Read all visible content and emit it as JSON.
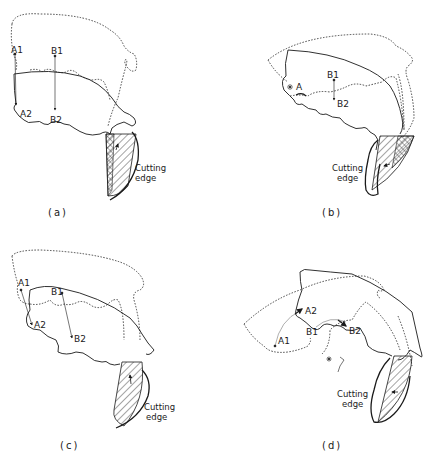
{
  "figure": {
    "panels": [
      {
        "id": "a",
        "caption": "(a)",
        "points": {
          "A1": "A1",
          "A2": "A2",
          "B1": "B1",
          "B2": "B2"
        },
        "edge_label_line1": "Cutting",
        "edge_label_line2": "edge"
      },
      {
        "id": "b",
        "caption": "(b)",
        "points": {
          "A": "A",
          "B1": "B1",
          "B2": "B2"
        },
        "edge_label_line1": "Cutting",
        "edge_label_line2": "edge"
      },
      {
        "id": "c",
        "caption": "(c)",
        "points": {
          "A1": "A1",
          "A2": "A2",
          "B1": "B1",
          "B2": "B2"
        },
        "edge_label_line1": "Cutting",
        "edge_label_line2": "edge"
      },
      {
        "id": "d",
        "caption": "(d)",
        "points": {
          "A1": "A1",
          "A2": "A2",
          "B1": "B1",
          "B2": "B2"
        },
        "edge_label_line1": "Cutting",
        "edge_label_line2": "edge"
      }
    ],
    "colors": {
      "ink": "#1a1a1a",
      "background": "#ffffff"
    }
  }
}
